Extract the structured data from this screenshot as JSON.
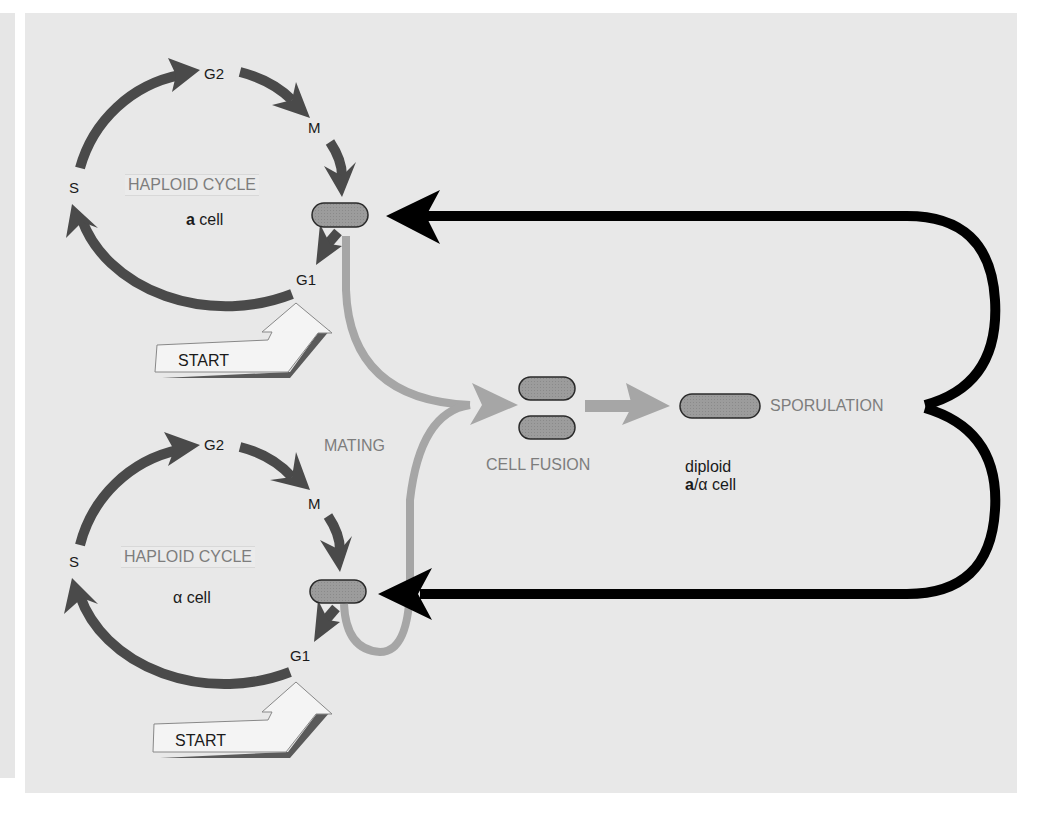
{
  "diagram": {
    "colors": {
      "panel_bg": "#e8e8e8",
      "cycle_arrow": "#4a4a4a",
      "mating_arrow": "#a6a6a6",
      "sporulation_arrow": "#000000",
      "cell_fill": "#9a9a9a",
      "label_gray": "#7d7d7d",
      "label_dark": "#1a1a1a"
    },
    "top_cycle": {
      "title": "HAPLOID CYCLE",
      "cell_bold": "a",
      "cell_rest": " cell",
      "phases": {
        "g2": "G2",
        "m": "M",
        "g1": "G1",
        "s": "S"
      },
      "start": "START"
    },
    "bottom_cycle": {
      "title": "HAPLOID CYCLE",
      "cell_greek": "α",
      "cell_rest": " cell",
      "phases": {
        "g2": "G2",
        "m": "M",
        "g1": "G1",
        "s": "S"
      },
      "start": "START"
    },
    "mating": {
      "label": "MATING"
    },
    "cell_fusion": {
      "label": "CELL FUSION"
    },
    "diploid": {
      "line1": "diploid",
      "line2_bold": "a",
      "line2_rest": "/α cell"
    },
    "sporulation": {
      "label": "SPORULATION"
    }
  }
}
